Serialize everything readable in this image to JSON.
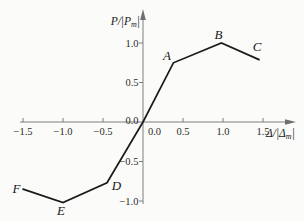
{
  "figure": {
    "background": "#fbfbf9",
    "curve_color": "#1b1b1b",
    "axis_color": "#6f6f6f",
    "text_color": "#2b2b2b"
  },
  "chart_data": {
    "type": "line",
    "title": "",
    "xlabel": "Δ/|Δm|",
    "ylabel": "P/|Pm|",
    "x_axis": {
      "label_pre": "Δ/|Δ",
      "label_sub": "m",
      "label_post": "|",
      "ticks": [
        -1.5,
        -1.0,
        -0.5,
        0.0,
        0.5,
        1.0,
        1.5
      ],
      "range": [
        -1.5,
        1.5
      ],
      "tick_label_format": "one-decimal"
    },
    "y_axis": {
      "label_pre": "P/|P",
      "label_sub": "m",
      "label_post": "|",
      "ticks": [
        -1.0,
        -0.5,
        0.0,
        0.5,
        1.0
      ],
      "range": [
        -1.0,
        1.0
      ],
      "tick_label_format": "one-decimal"
    },
    "grid": false,
    "legend": false,
    "series": [
      {
        "name": "skeleton-curve",
        "points": [
          [
            -1.5,
            -0.85
          ],
          [
            -1.0,
            -1.02
          ],
          [
            -0.45,
            -0.77
          ],
          [
            0,
            0
          ],
          [
            0.38,
            0.75
          ],
          [
            0.98,
            1.0
          ],
          [
            1.45,
            0.79
          ]
        ]
      }
    ],
    "point_labels": [
      {
        "text": "A",
        "x": 0.38,
        "y": 0.75,
        "dx": -6.5,
        "dy": -2.5
      },
      {
        "text": "B",
        "x": 0.98,
        "y": 1.0,
        "dx": -3,
        "dy": -4.5
      },
      {
        "text": "C",
        "x": 1.45,
        "y": 0.79,
        "dx": -2,
        "dy": -8.5
      },
      {
        "text": "D",
        "x": -0.45,
        "y": -0.77,
        "dx": 9.5,
        "dy": 7.5
      },
      {
        "text": "E",
        "x": -1.0,
        "y": -1.02,
        "dx": -2,
        "dy": 12
      },
      {
        "text": "F",
        "x": -1.5,
        "y": -0.85,
        "dx": -6.5,
        "dy": 3.5
      }
    ]
  }
}
